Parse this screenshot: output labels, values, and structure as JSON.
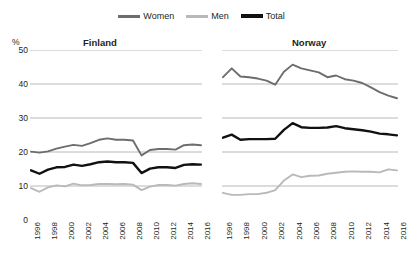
{
  "unit_label": "%",
  "colors": {
    "women": "#6d6d6d",
    "men": "#b9b9b9",
    "total": "#111111",
    "gridline": "#8c8c8c",
    "text": "#231f20",
    "background": "#ffffff"
  },
  "legend": {
    "items": [
      {
        "label": "Women",
        "color": "#6d6d6d",
        "icon": "line-swatch-icon"
      },
      {
        "label": "Men",
        "color": "#b9b9b9",
        "icon": "line-swatch-icon"
      },
      {
        "label": "Total",
        "color": "#111111",
        "icon": "line-swatch-icon"
      }
    ]
  },
  "chart_data": [
    {
      "type": "line",
      "title": "Finland",
      "xlabel": "",
      "ylabel": "%",
      "ylim": [
        0,
        50
      ],
      "yticks": [
        0,
        10,
        20,
        30,
        40,
        50
      ],
      "grid": true,
      "legend_position": "top-center",
      "x": [
        1996,
        1997,
        1998,
        1999,
        2000,
        2001,
        2002,
        2003,
        2004,
        2005,
        2006,
        2007,
        2008,
        2009,
        2010,
        2011,
        2012,
        2013,
        2014,
        2015,
        2016
      ],
      "series": [
        {
          "name": "Women",
          "color": "#6d6d6d",
          "values": [
            20.1,
            19.8,
            20.2,
            21.0,
            21.6,
            22.1,
            21.8,
            22.6,
            23.6,
            24.0,
            23.6,
            23.6,
            23.4,
            19.0,
            20.6,
            20.9,
            20.9,
            20.7,
            22.0,
            22.2,
            22.0
          ]
        },
        {
          "name": "Men",
          "color": "#b9b9b9",
          "values": [
            9.4,
            8.3,
            9.6,
            10.2,
            9.9,
            10.7,
            10.2,
            10.3,
            10.6,
            10.6,
            10.5,
            10.6,
            10.4,
            8.8,
            9.8,
            10.3,
            10.3,
            10.1,
            10.6,
            10.8,
            10.6
          ]
        },
        {
          "name": "Total",
          "color": "#111111",
          "values": [
            14.6,
            13.6,
            14.8,
            15.5,
            15.6,
            16.3,
            15.9,
            16.4,
            17.0,
            17.2,
            17.0,
            17.0,
            16.8,
            13.8,
            15.1,
            15.5,
            15.5,
            15.3,
            16.2,
            16.4,
            16.3
          ]
        }
      ]
    },
    {
      "type": "line",
      "title": "Norway",
      "xlabel": "",
      "ylabel": "%",
      "ylim": [
        0,
        50
      ],
      "yticks": [
        0,
        10,
        20,
        30,
        40,
        50
      ],
      "grid": true,
      "legend_position": "top-center",
      "x": [
        1996,
        1997,
        1998,
        1999,
        2000,
        2001,
        2002,
        2003,
        2004,
        2005,
        2006,
        2007,
        2008,
        2009,
        2010,
        2011,
        2012,
        2013,
        2014,
        2015,
        2016
      ],
      "series": [
        {
          "name": "Women",
          "color": "#6d6d6d",
          "values": [
            42.0,
            44.6,
            42.2,
            42.0,
            41.6,
            41.0,
            39.8,
            43.6,
            45.7,
            44.6,
            44.0,
            43.4,
            42.0,
            42.5,
            41.4,
            41.0,
            40.3,
            39.0,
            37.6,
            36.6,
            35.8
          ]
        },
        {
          "name": "Men",
          "color": "#b9b9b9",
          "values": [
            8.0,
            7.4,
            7.4,
            7.6,
            7.6,
            8.0,
            8.8,
            11.6,
            13.4,
            12.6,
            13.0,
            13.1,
            13.6,
            13.9,
            14.2,
            14.3,
            14.2,
            14.2,
            14.0,
            14.9,
            14.6
          ]
        },
        {
          "name": "Total",
          "color": "#111111",
          "values": [
            24.2,
            25.1,
            23.6,
            23.8,
            23.8,
            23.8,
            23.9,
            26.5,
            28.5,
            27.3,
            27.1,
            27.1,
            27.2,
            27.6,
            27.0,
            26.7,
            26.4,
            26.0,
            25.4,
            25.2,
            24.9
          ]
        }
      ]
    }
  ],
  "x_tick_labels": [
    "1996",
    "1998",
    "2000",
    "2002",
    "2004",
    "2006",
    "2008",
    "2010",
    "2012",
    "2014",
    "2016"
  ]
}
